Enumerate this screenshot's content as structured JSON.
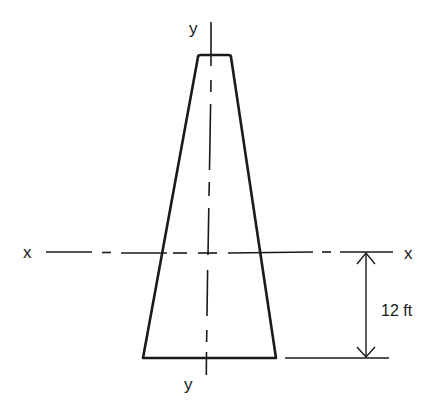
{
  "figure": {
    "type": "cross-section",
    "shape": "tapered trapezoid (narrow top, wide bottom)",
    "axes": {
      "x_left_label": "x",
      "x_right_label": "x",
      "y_top_label": "y",
      "y_bottom_label": "y"
    },
    "dimension": {
      "label": "12 ft",
      "description": "distance from base to x-x centroidal axis"
    },
    "colors": {
      "ink": "#1a1a1a",
      "background": "#ffffff"
    }
  }
}
